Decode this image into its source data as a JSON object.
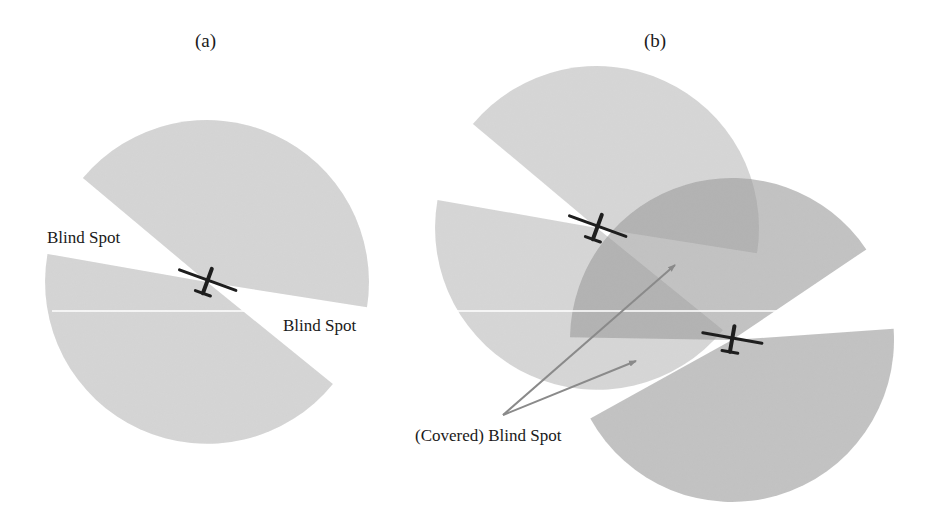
{
  "panels": [
    {
      "id": "a",
      "title": "(a)",
      "title_pos": [
        206,
        42
      ],
      "uavs": [
        {
          "name": "uav-a",
          "center": [
            207,
            282
          ],
          "heading_deg": -70,
          "sectors": [
            {
              "start_deg": 220,
              "end_deg": 369,
              "radius": 162,
              "fill": "#d6d6d6",
              "opacity": 1
            },
            {
              "start_deg": 39,
              "end_deg": 190,
              "radius": 162,
              "fill": "#d6d6d6",
              "opacity": 1
            }
          ]
        }
      ],
      "labels": [
        {
          "text": "Blind Spot",
          "pos": [
            47,
            228
          ],
          "name": "blind-spot-label-left"
        },
        {
          "text": "Blind Spot",
          "pos": [
            283,
            316
          ],
          "name": "blind-spot-label-right"
        }
      ]
    },
    {
      "id": "b",
      "title": "(b)",
      "title_pos": [
        655,
        42
      ],
      "uavs": [
        {
          "name": "uav-b1",
          "center": [
            597,
            228
          ],
          "heading_deg": -70,
          "sectors": [
            {
              "start_deg": 220,
              "end_deg": 369,
              "radius": 162,
              "fill": "#c8c8c8",
              "opacity": 0.75
            },
            {
              "start_deg": 39,
              "end_deg": 190,
              "radius": 162,
              "fill": "#c8c8c8",
              "opacity": 0.75
            }
          ]
        },
        {
          "name": "uav-b2",
          "center": [
            732,
            340
          ],
          "heading_deg": -80,
          "sectors": [
            {
              "start_deg": 181,
              "end_deg": 326,
              "radius": 162,
              "fill": "#9a9a9a",
              "opacity": 0.6
            },
            {
              "start_deg": -4,
              "end_deg": 151,
              "radius": 162,
              "fill": "#9a9a9a",
              "opacity": 0.6
            }
          ]
        }
      ],
      "labels": [
        {
          "text": "(Covered) Blind Spot",
          "pos": [
            415,
            426
          ],
          "name": "covered-blind-spot-label"
        }
      ],
      "arrows": [
        {
          "from": [
            503,
            415
          ],
          "to": [
            675,
            265
          ],
          "color": "#8a8a8a"
        },
        {
          "from": [
            503,
            415
          ],
          "to": [
            636,
            361
          ],
          "color": "#8a8a8a"
        }
      ]
    }
  ],
  "divider_line": {
    "y": 311,
    "segments": [
      [
        52,
        320
      ],
      [
        443,
        885
      ]
    ],
    "color": "#ffffff"
  },
  "colors": {
    "uav": "#1e1e1e",
    "text": "#1a1a1a"
  }
}
